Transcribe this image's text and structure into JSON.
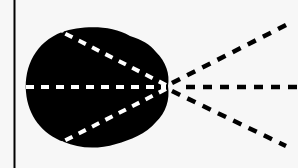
{
  "diagram": {
    "colors": {
      "background": "#f7f7f7",
      "shape": "#000000",
      "inner_rays": "#ffffff",
      "outer_rays": "#000000",
      "border": "#000000"
    },
    "focal_point": [
      168,
      86
    ],
    "rays": [
      {
        "name": "upper",
        "angle_deg": -27
      },
      {
        "name": "center",
        "angle_deg": 0
      },
      {
        "name": "lower",
        "angle_deg": 27
      }
    ]
  }
}
